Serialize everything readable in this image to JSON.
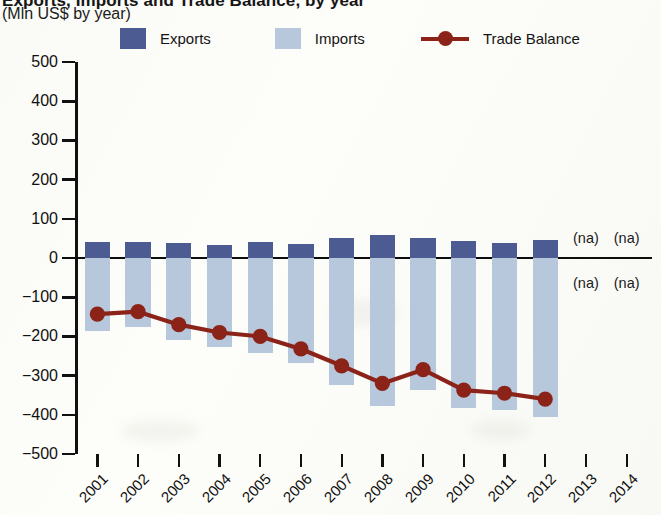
{
  "header": {
    "title_clipped": "Exports, Imports and Trade Balance, by year",
    "subtitle": "(Mln US$ by year)"
  },
  "legend": {
    "position": "top",
    "items": [
      {
        "label": "Exports",
        "type": "swatch",
        "color": "#4c5c93",
        "name": "legend-exports"
      },
      {
        "label": "Imports",
        "type": "swatch",
        "color": "#b7c8dd",
        "name": "legend-imports"
      },
      {
        "label": "Trade Balance",
        "type": "line-marker",
        "color": "#8b2318",
        "name": "legend-trade-balance"
      }
    ]
  },
  "chart_data": {
    "type": "bar",
    "title": "Exports, Imports and Trade Balance, by year",
    "subtitle": "(Mln US$ by year)",
    "xlabel": "",
    "ylabel": "Mln US$",
    "ylim": [
      -500,
      500
    ],
    "yticks": [
      500,
      400,
      300,
      200,
      100,
      0,
      -100,
      -200,
      -300,
      -400,
      -500
    ],
    "ytick_labels": [
      "500",
      "400",
      "300",
      "200",
      "100",
      "0",
      "−100",
      "−200",
      "−300",
      "−400",
      "−500"
    ],
    "grid": false,
    "categories": [
      "2001",
      "2002",
      "2003",
      "2004",
      "2005",
      "2006",
      "2007",
      "2008",
      "2009",
      "2010",
      "2011",
      "2012",
      "2013",
      "2014"
    ],
    "series": [
      {
        "name": "Exports",
        "color": "#4c5c93",
        "values": [
          42,
          40,
          38,
          34,
          42,
          36,
          50,
          58,
          52,
          44,
          38,
          46,
          null,
          null
        ]
      },
      {
        "name": "Imports",
        "color": "#b7c8dd",
        "values": [
          -185,
          -175,
          -208,
          -228,
          -242,
          -268,
          -325,
          -378,
          -338,
          -382,
          -388,
          -405,
          null,
          null
        ]
      },
      {
        "name": "Trade Balance",
        "type": "line",
        "color": "#8b2318",
        "values": [
          -143,
          -137,
          -170,
          -190,
          -200,
          -232,
          -275,
          -320,
          -285,
          -337,
          -345,
          -360,
          null,
          null
        ]
      }
    ],
    "annotations": [
      {
        "text": "(na)",
        "category": "2013",
        "side": "above-zero"
      },
      {
        "text": "(na)",
        "category": "2014",
        "side": "above-zero"
      },
      {
        "text": "(na)",
        "category": "2013",
        "side": "below-zero"
      },
      {
        "text": "(na)",
        "category": "2014",
        "side": "below-zero"
      }
    ]
  }
}
